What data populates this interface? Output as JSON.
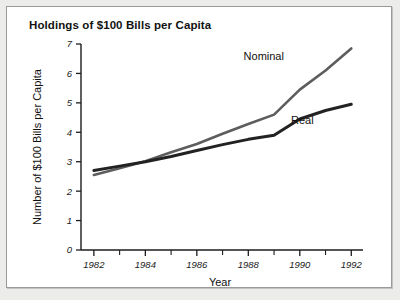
{
  "figure": {
    "title": "Holdings of $100 Bills per Capita",
    "background": "#ffffff",
    "page_background": "#ececeb",
    "border_color": "#9a9a9a"
  },
  "chart_data": {
    "type": "line",
    "title": "Holdings of $100 Bills per Capita",
    "xlabel": "Year",
    "ylabel": "Number of $100 Bills per Capita",
    "xlim": [
      1981.5,
      1992.3
    ],
    "ylim": [
      0,
      7
    ],
    "grid": false,
    "legend": "inline-labels",
    "x": [
      1982,
      1983,
      1984,
      1985,
      1986,
      1987,
      1988,
      1989,
      1990,
      1991,
      1992
    ],
    "xticks_major": [
      1982,
      1984,
      1986,
      1988,
      1990,
      1992
    ],
    "xticks_minor": [
      1983,
      1985,
      1987,
      1989,
      1991
    ],
    "xtick_labels": [
      "1982",
      "1984",
      "1986",
      "1988",
      "1990",
      "1992"
    ],
    "yticks": [
      0,
      1,
      2,
      3,
      4,
      5,
      6,
      7
    ],
    "ytick_labels": [
      "0",
      "1",
      "2",
      "3",
      "4",
      "5",
      "6",
      "7"
    ],
    "series": [
      {
        "name": "Nominal",
        "color": "#5d5d5d",
        "width": 2.6,
        "label_x": 1988.6,
        "label_y": 6.45,
        "values": [
          2.55,
          2.78,
          3.02,
          3.32,
          3.6,
          3.95,
          4.28,
          4.6,
          5.45,
          6.1,
          6.85
        ]
      },
      {
        "name": "Real",
        "color": "#222222",
        "width": 3.0,
        "label_x": 1990.1,
        "label_y": 4.28,
        "values": [
          2.7,
          2.85,
          3.0,
          3.18,
          3.38,
          3.58,
          3.76,
          3.9,
          4.45,
          4.74,
          4.95
        ]
      }
    ]
  }
}
